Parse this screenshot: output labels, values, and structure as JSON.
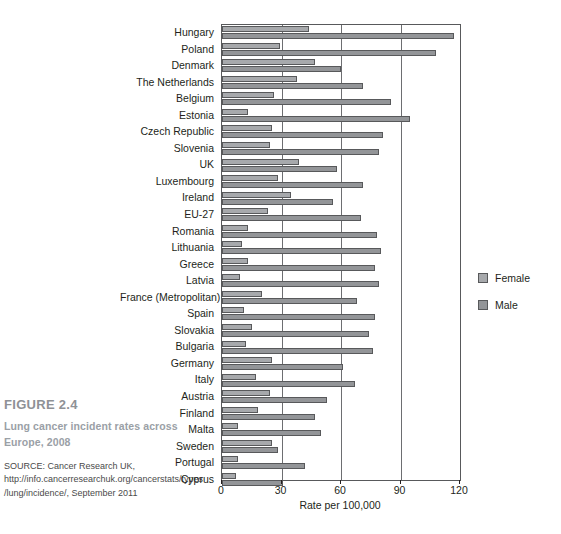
{
  "caption": {
    "figure_number": "FIGURE 2.4",
    "title": "Lung cancer incident rates across Europe, 2008",
    "source": "SOURCE: Cancer Research UK, http://info.cancerresearchuk.org/cancerstats/types/lung/incidence/, September 2011"
  },
  "legend": {
    "position": "right",
    "items": [
      {
        "label": "Female",
        "color": "#a7a9ac"
      },
      {
        "label": "Male",
        "color": "#939598"
      }
    ]
  },
  "chart_data": {
    "type": "bar",
    "orientation": "horizontal",
    "title": "Lung cancer incident rates across Europe, 2008",
    "xlabel": "Rate per 100,000",
    "ylabel": "",
    "xlim": [
      0,
      120
    ],
    "xticks": [
      0,
      30,
      60,
      90,
      120
    ],
    "grid": true,
    "categories": [
      "Hungary",
      "Poland",
      "Denmark",
      "The Netherlands",
      "Belgium",
      "Estonia",
      "Czech Republic",
      "Slovenia",
      "UK",
      "Luxembourg",
      "Ireland",
      "EU-27",
      "Romania",
      "Lithuania",
      "Greece",
      "Latvia",
      "France (Metropolitan)",
      "Spain",
      "Slovakia",
      "Bulgaria",
      "Germany",
      "Italy",
      "Austria",
      "Finland",
      "Malta",
      "Sweden",
      "Portugal",
      "Cyprus"
    ],
    "series": [
      {
        "name": "Female",
        "color": "#a7a9ac",
        "values": [
          44,
          29,
          47,
          38,
          26,
          13,
          25,
          24,
          39,
          28,
          35,
          23,
          13,
          10,
          13,
          9,
          20,
          11,
          15,
          12,
          25,
          17,
          24,
          18,
          8,
          25,
          8,
          7
        ]
      },
      {
        "name": "Male",
        "color": "#939598",
        "values": [
          117,
          108,
          60,
          71,
          85,
          95,
          81,
          79,
          58,
          71,
          56,
          70,
          78,
          80,
          77,
          79,
          68,
          77,
          74,
          76,
          61,
          67,
          53,
          47,
          50,
          28,
          42,
          31
        ]
      }
    ]
  }
}
